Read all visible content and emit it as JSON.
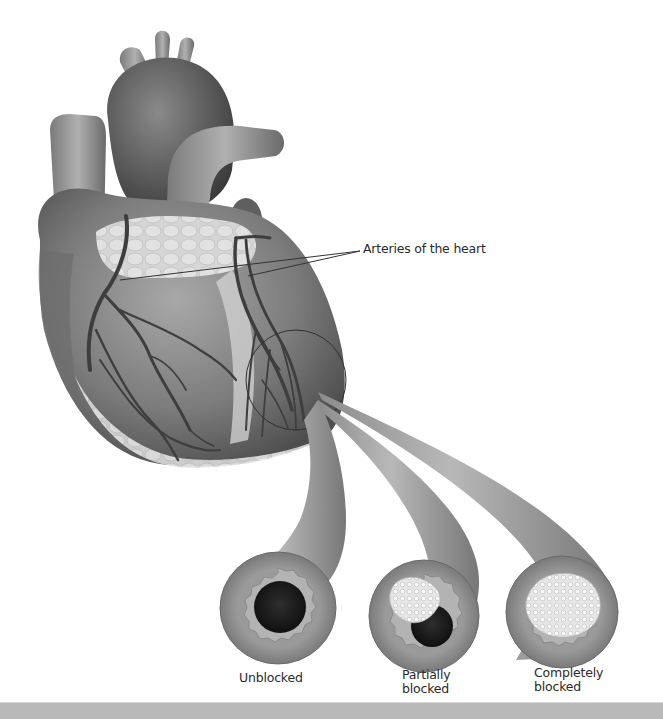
{
  "figure": {
    "colors": {
      "tissue_dark": "#5a5a5a",
      "tissue_mid": "#8a8a8a",
      "tissue_light": "#b5b5b5",
      "fat": "#dcdcdc",
      "vessel": "#3e3e3e",
      "lumen": "#1c1c1c",
      "plaque": "#eeeeee",
      "bar": "#b9b9b9"
    },
    "labels": {
      "arteries": "Arteries of the heart",
      "unblocked": "Unblocked",
      "partially_line1": "Partially",
      "partially_line2": "blocked",
      "completely_line1": "Completely",
      "completely_line2": "blocked"
    },
    "cross_sections": [
      {
        "name": "Unblocked",
        "blockage": "none"
      },
      {
        "name": "Partially blocked",
        "blockage": "partial"
      },
      {
        "name": "Completely blocked",
        "blockage": "complete"
      }
    ]
  }
}
